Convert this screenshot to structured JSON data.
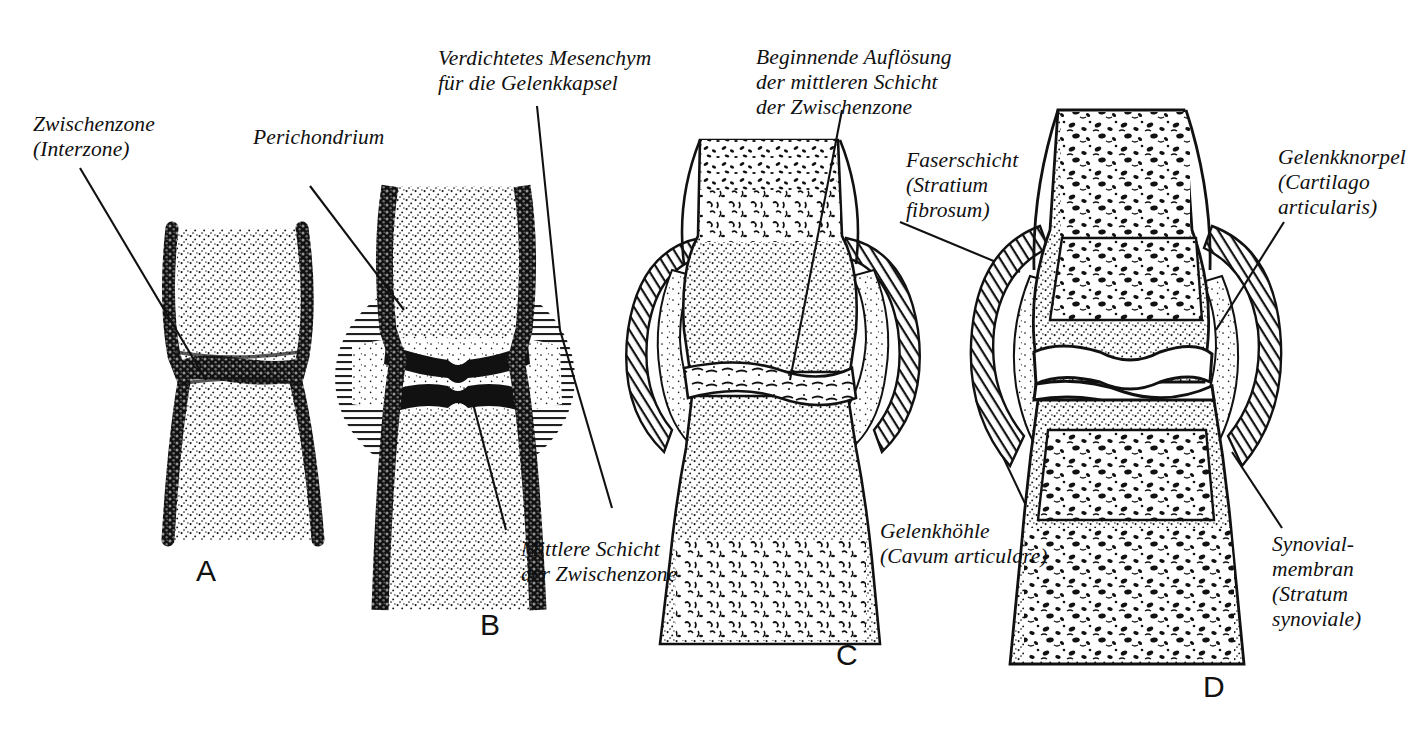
{
  "figure": {
    "background_color": "#ffffff",
    "ink_color": "#111111",
    "panels": [
      {
        "id": "A",
        "letter": "A",
        "caption": "Blastem mit Zwischenzone"
      },
      {
        "id": "B",
        "letter": "B",
        "caption": "Verdichtetes Mesenchym / Perichondrium"
      },
      {
        "id": "C",
        "letter": "C",
        "caption": "Beginnende Kavitation"
      },
      {
        "id": "D",
        "letter": "D",
        "caption": "Fertiges Gelenk"
      }
    ],
    "labels": [
      {
        "id": "zwischenzone",
        "lines": [
          "Zwischenzone",
          "(Interzone)"
        ]
      },
      {
        "id": "perichondrium",
        "lines": [
          "Perichondrium"
        ]
      },
      {
        "id": "verdichtetes-mesenchym",
        "lines": [
          "Verdichtetes Mesenchym",
          "für die Gelenkkapsel"
        ]
      },
      {
        "id": "mittlere-schicht",
        "lines": [
          "Mittlere Schicht",
          "der Zwischenzone"
        ]
      },
      {
        "id": "beginnende-aufloesung",
        "lines": [
          "Beginnende Auflösung",
          "der mittleren Schicht",
          "der Zwischenzone"
        ]
      },
      {
        "id": "faserschicht",
        "lines": [
          "Faserschicht",
          "(Stratium",
          "fibrosum)"
        ]
      },
      {
        "id": "gelenkhoehle",
        "lines": [
          "Gelenkhöhle",
          "(Cavum articulare)"
        ]
      },
      {
        "id": "gelenkknorpel",
        "lines": [
          "Gelenkknorpel",
          "(Cartilago",
          "articularis)"
        ]
      },
      {
        "id": "synovialmembran",
        "lines": [
          "Synovial-",
          "membran",
          "(Stratum",
          "synoviale)"
        ]
      }
    ]
  }
}
